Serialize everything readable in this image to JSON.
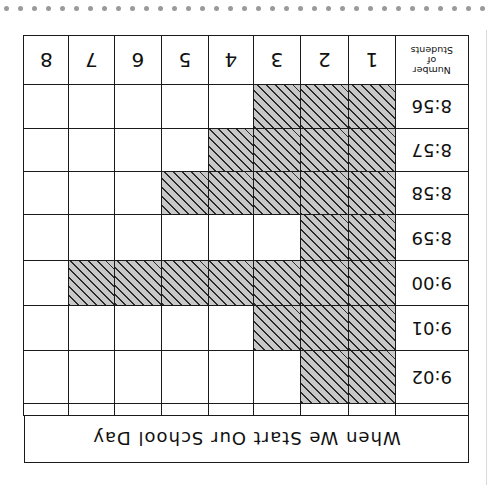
{
  "chart_data": {
    "type": "table",
    "subtype": "pictograph-bar (shaded grid)",
    "orientation_in_image": "rotated 180 degrees",
    "title": "When We Start Our School Day",
    "header_label": "Number of Students",
    "columns": [
      "1",
      "2",
      "3",
      "4",
      "5",
      "6",
      "7",
      "8"
    ],
    "categories": [
      "8:56",
      "8:57",
      "8:58",
      "8:59",
      "9:00",
      "9:01",
      "9:02"
    ],
    "values": [
      3,
      4,
      5,
      2,
      7,
      3,
      2
    ],
    "xlabel": "Number of Students",
    "ylabel": "Time",
    "xlim": [
      0,
      8
    ],
    "grid": true
  },
  "header": {
    "label_line1": "Number",
    "label_line2": "of",
    "label_line3": "Students"
  },
  "colors": {
    "fill": "#c8c8c8",
    "hatch": "#2a2a2a",
    "line": "#1a1a1a"
  }
}
